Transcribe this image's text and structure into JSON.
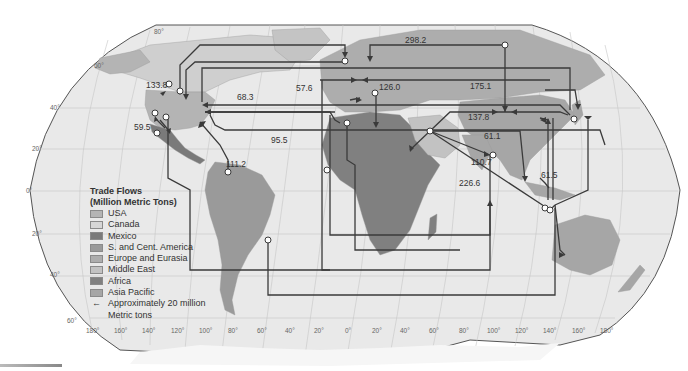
{
  "legend": {
    "title_line1": "Trade Flows",
    "title_line2": "(Million Metric Tons)",
    "items": [
      {
        "label": "USA",
        "color": "#b4b4b4"
      },
      {
        "label": "Canada",
        "color": "#d6d6d6"
      },
      {
        "label": "Mexico",
        "color": "#7a7a7a"
      },
      {
        "label": "S. and Cent. America",
        "color": "#9a9a9a"
      },
      {
        "label": "Europe and Eurasia",
        "color": "#adadad"
      },
      {
        "label": "Middle East",
        "color": "#c2c2c2"
      },
      {
        "label": "Africa",
        "color": "#808080"
      },
      {
        "label": "Asia Pacific",
        "color": "#a6a6a6"
      }
    ],
    "arrow_symbol": "←",
    "arrow_label_line1": "Approximately 20 million",
    "arrow_label_line2": "Metric tons"
  },
  "flow_labels": [
    {
      "text": "133.8",
      "x": 146,
      "y": 88
    },
    {
      "text": "59.5",
      "x": 134,
      "y": 130
    },
    {
      "text": "111.2",
      "x": 226,
      "y": 167
    },
    {
      "text": "68.3",
      "x": 237,
      "y": 100
    },
    {
      "text": "57.6",
      "x": 296,
      "y": 91
    },
    {
      "text": "95.5",
      "x": 271,
      "y": 143
    },
    {
      "text": "126.0",
      "x": 379,
      "y": 90
    },
    {
      "text": "298.2",
      "x": 405,
      "y": 43
    },
    {
      "text": "175.1",
      "x": 470,
      "y": 89
    },
    {
      "text": "137.8",
      "x": 468,
      "y": 120
    },
    {
      "text": "61.1",
      "x": 484,
      "y": 139
    },
    {
      "text": "110.7",
      "x": 471,
      "y": 165
    },
    {
      "text": "226.6",
      "x": 459,
      "y": 186
    },
    {
      "text": "61.5",
      "x": 541,
      "y": 178
    }
  ],
  "latitude_labels": [
    {
      "text": "80°",
      "x": 154,
      "y": 34
    },
    {
      "text": "60°",
      "x": 94,
      "y": 68
    },
    {
      "text": "40°",
      "x": 50,
      "y": 110
    },
    {
      "text": "20°",
      "x": 32,
      "y": 151
    },
    {
      "text": "0°",
      "x": 26,
      "y": 193
    },
    {
      "text": "20°",
      "x": 32,
      "y": 236
    },
    {
      "text": "40°",
      "x": 50,
      "y": 277
    },
    {
      "text": "60°",
      "x": 67,
      "y": 323
    }
  ],
  "longitude_labels": [
    {
      "text": "180°",
      "x": 86,
      "y": 333
    },
    {
      "text": "160°",
      "x": 114,
      "y": 333
    },
    {
      "text": "140°",
      "x": 142,
      "y": 333
    },
    {
      "text": "120°",
      "x": 171,
      "y": 333
    },
    {
      "text": "100°",
      "x": 199,
      "y": 333
    },
    {
      "text": "80°",
      "x": 228,
      "y": 333
    },
    {
      "text": "60°",
      "x": 257,
      "y": 333
    },
    {
      "text": "40°",
      "x": 285,
      "y": 333
    },
    {
      "text": "20°",
      "x": 314,
      "y": 333
    },
    {
      "text": "0°",
      "x": 345,
      "y": 333
    },
    {
      "text": "20°",
      "x": 372,
      "y": 333
    },
    {
      "text": "40°",
      "x": 400,
      "y": 333
    },
    {
      "text": "60°",
      "x": 429,
      "y": 333
    },
    {
      "text": "80°",
      "x": 459,
      "y": 333
    },
    {
      "text": "100°",
      "x": 487,
      "y": 333
    },
    {
      "text": "120°",
      "x": 515,
      "y": 333
    },
    {
      "text": "140°",
      "x": 543,
      "y": 333
    },
    {
      "text": "160°",
      "x": 572,
      "y": 333
    },
    {
      "text": "180°",
      "x": 600,
      "y": 333
    }
  ],
  "colors": {
    "ocean": "#e9e9e9",
    "grid": "#c8c8c8",
    "border": "#555555",
    "flow_line": "#3a3a3a",
    "node_fill": "#ffffff"
  }
}
